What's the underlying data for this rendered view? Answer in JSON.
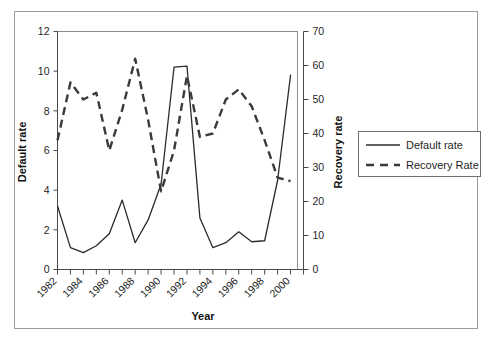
{
  "figure": {
    "kind": "dual-axis-line-chart",
    "background": "#ffffff",
    "frame_color": "#9a9a9a"
  },
  "axis_titles": {
    "x": "Year",
    "y_left": "Default rate",
    "y_right": "Recovery rate"
  },
  "legend": {
    "entries": [
      {
        "label": "Default rate",
        "style": "solid",
        "color": "#2b2b2b"
      },
      {
        "label": "Recovery Rate",
        "style": "dashed",
        "color": "#3a3a3a"
      }
    ]
  },
  "axes": {
    "left_ticks": [
      "12",
      "10",
      "8",
      "6",
      "4",
      "2",
      "0"
    ],
    "right_ticks": [
      "70",
      "60",
      "50",
      "40",
      "30",
      "20",
      "10",
      "0"
    ],
    "x_ticks": [
      "1982",
      "1984",
      "1986",
      "1988",
      "1990",
      "1992",
      "1994",
      "1996",
      "1998",
      "2000"
    ]
  },
  "chart_data": {
    "type": "line",
    "title": "",
    "subtitle": "",
    "xlabel": "Year",
    "ylabel": "Default rate",
    "y2label": "Recovery rate",
    "grid": false,
    "legend_position": "right",
    "x": [
      1982,
      1983,
      1984,
      1985,
      1986,
      1987,
      1988,
      1989,
      1990,
      1991,
      1992,
      1993,
      1994,
      1995,
      1996,
      1997,
      1998,
      1999,
      2000
    ],
    "xlim": [
      1982,
      2001
    ],
    "ylim": [
      0,
      12
    ],
    "y2lim": [
      0,
      70
    ],
    "xtick_labels": [
      "1982",
      "1984",
      "1986",
      "1988",
      "1990",
      "1992",
      "1994",
      "1996",
      "1998",
      "2000"
    ],
    "xtick_values": [
      1982,
      1984,
      1986,
      1988,
      1990,
      1992,
      1994,
      1996,
      1998,
      2000
    ],
    "ytick_values": [
      0,
      2,
      4,
      6,
      8,
      10,
      12
    ],
    "y2tick_values": [
      0,
      10,
      20,
      30,
      40,
      50,
      60,
      70
    ],
    "series": [
      {
        "name": "Default rate",
        "axis": "left",
        "style": "solid",
        "color": "#2b2b2b",
        "values": [
          3.2,
          1.1,
          0.85,
          1.2,
          1.8,
          3.5,
          1.35,
          2.5,
          4.3,
          10.2,
          10.25,
          2.6,
          1.1,
          1.35,
          1.9,
          1.4,
          1.45,
          4.5,
          9.8
        ]
      },
      {
        "name": "Recovery Rate",
        "axis": "right",
        "style": "dashed",
        "color": "#3a3a3a",
        "values": [
          38,
          55,
          50,
          52,
          35,
          47,
          62,
          44,
          23,
          35,
          57,
          39,
          40,
          50,
          53,
          48,
          38,
          27,
          26
        ]
      }
    ]
  }
}
